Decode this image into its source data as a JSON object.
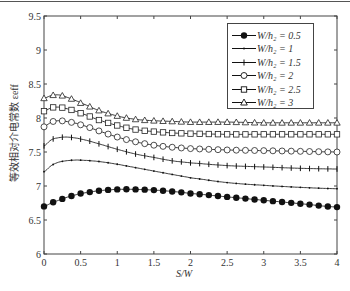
{
  "chart_data": {
    "type": "line",
    "title": "",
    "xlabel": "S/W",
    "ylabel": "等效相对介电常数 ε_eff",
    "xlim": [
      0,
      4
    ],
    "ylim": [
      6,
      9.5
    ],
    "xticks": [
      "0",
      "0.5",
      "1",
      "1.5",
      "2",
      "2.5",
      "3",
      "3.5",
      "4"
    ],
    "yticks": [
      "6",
      "6.5",
      "7",
      "7.5",
      "8",
      "8.5",
      "9",
      "9.5"
    ],
    "grid": false,
    "legend_position": "upper right",
    "x": [
      0,
      0.1,
      0.2,
      0.3,
      0.4,
      0.5,
      0.75,
      1.0,
      1.25,
      1.5,
      1.75,
      2.0,
      2.5,
      3.0,
      3.5,
      4.0
    ],
    "series": [
      {
        "name": "W/h2 = 0.5",
        "marker": "filled-circle",
        "values": [
          6.7,
          6.75,
          6.79,
          6.83,
          6.86,
          6.89,
          6.93,
          6.95,
          6.95,
          6.94,
          6.92,
          6.89,
          6.84,
          6.79,
          6.74,
          6.69
        ]
      },
      {
        "name": "W/h2 = 1",
        "marker": "dot",
        "values": [
          7.21,
          7.3,
          7.35,
          7.37,
          7.38,
          7.38,
          7.36,
          7.32,
          7.27,
          7.22,
          7.17,
          7.12,
          7.05,
          7.01,
          6.98,
          6.96
        ]
      },
      {
        "name": "W/h2 = 1.5",
        "marker": "plus",
        "values": [
          7.59,
          7.68,
          7.71,
          7.72,
          7.71,
          7.69,
          7.62,
          7.54,
          7.47,
          7.42,
          7.37,
          7.34,
          7.3,
          7.28,
          7.26,
          7.25
        ]
      },
      {
        "name": "W/h2 = 2",
        "marker": "open-circle",
        "values": [
          7.87,
          7.94,
          7.96,
          7.95,
          7.93,
          7.9,
          7.81,
          7.72,
          7.65,
          7.6,
          7.57,
          7.55,
          7.53,
          7.52,
          7.51,
          7.5
        ]
      },
      {
        "name": "W/h2 = 2.5",
        "marker": "open-square",
        "values": [
          8.1,
          8.15,
          8.16,
          8.14,
          8.11,
          8.07,
          7.97,
          7.89,
          7.83,
          7.8,
          7.78,
          7.77,
          7.76,
          7.76,
          7.76,
          7.76
        ]
      },
      {
        "name": "W/h2 = 3",
        "marker": "open-triangle",
        "values": [
          8.29,
          8.33,
          8.34,
          8.31,
          8.27,
          8.22,
          8.11,
          8.03,
          7.98,
          7.96,
          7.95,
          7.94,
          7.94,
          7.93,
          7.93,
          7.93
        ]
      }
    ]
  },
  "legend": {
    "items": [
      {
        "label": "W/h₂ = 0.5"
      },
      {
        "label": "W/h₂ = 1"
      },
      {
        "label": "W/h₂ = 1.5"
      },
      {
        "label": "W/h₂ = 2"
      },
      {
        "label": "W/h₂ = 2.5"
      },
      {
        "label": "W/h₂ = 3"
      }
    ]
  },
  "axes": {
    "xlabel": "S/W",
    "ylabel": "等效相对介电常数 εeff"
  }
}
